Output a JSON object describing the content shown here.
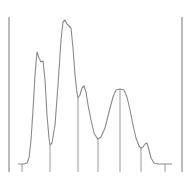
{
  "chart_data": {
    "type": "line",
    "title": "",
    "xlabel": "",
    "ylabel": "",
    "grid": false,
    "legend": null,
    "colors": {
      "trace": "#8a8a8a",
      "lines": "#9a9a9a",
      "border": "#8c8c8c"
    },
    "trace_points": [
      [
        18,
        164
      ],
      [
        24,
        164
      ],
      [
        27,
        163
      ],
      [
        29,
        158
      ],
      [
        31,
        140
      ],
      [
        33,
        110
      ],
      [
        35,
        75
      ],
      [
        37,
        52
      ],
      [
        39,
        58
      ],
      [
        41,
        62
      ],
      [
        43,
        61
      ],
      [
        45,
        80
      ],
      [
        47,
        115
      ],
      [
        49,
        138
      ],
      [
        50,
        145
      ],
      [
        52,
        143
      ],
      [
        55,
        125
      ],
      [
        58,
        85
      ],
      [
        61,
        40
      ],
      [
        63,
        22
      ],
      [
        65,
        20
      ],
      [
        67,
        24
      ],
      [
        69,
        26
      ],
      [
        71,
        28
      ],
      [
        73,
        48
      ],
      [
        75,
        75
      ],
      [
        77,
        93
      ],
      [
        78,
        98
      ],
      [
        80,
        95
      ],
      [
        82,
        88
      ],
      [
        84,
        86
      ],
      [
        86,
        92
      ],
      [
        88,
        105
      ],
      [
        91,
        120
      ],
      [
        94,
        133
      ],
      [
        97,
        138
      ],
      [
        98,
        139
      ],
      [
        101,
        137
      ],
      [
        105,
        128
      ],
      [
        109,
        112
      ],
      [
        113,
        97
      ],
      [
        116,
        90
      ],
      [
        120,
        89
      ],
      [
        124,
        90
      ],
      [
        127,
        97
      ],
      [
        130,
        110
      ],
      [
        133,
        125
      ],
      [
        136,
        138
      ],
      [
        139,
        146
      ],
      [
        141,
        148
      ],
      [
        143,
        147
      ],
      [
        145,
        144
      ],
      [
        147,
        143
      ],
      [
        149,
        150
      ],
      [
        151,
        158
      ],
      [
        154,
        163
      ],
      [
        158,
        164
      ],
      [
        172,
        164
      ]
    ],
    "boundary_lines_x": [
      50,
      78,
      98,
      120,
      141
    ],
    "baseline_ticks_x": [
      22,
      165
    ],
    "baseline_y": 164,
    "axis_bottom_y": 172,
    "frame": {
      "left_x": 9,
      "right_x": 182,
      "top_y": 17,
      "bottom_y": 172
    },
    "peaks": [
      {
        "id": 1,
        "apex_x": 37,
        "apex_y": 52,
        "start_x": 22,
        "end_x": 50
      },
      {
        "id": 2,
        "apex_x": 65,
        "apex_y": 20,
        "start_x": 50,
        "end_x": 78
      },
      {
        "id": 3,
        "apex_x": 84,
        "apex_y": 86,
        "start_x": 78,
        "end_x": 98
      },
      {
        "id": 4,
        "apex_x": 120,
        "apex_y": 89,
        "start_x": 98,
        "end_x": 141
      },
      {
        "id": 5,
        "apex_x": 147,
        "apex_y": 143,
        "start_x": 141,
        "end_x": 165
      }
    ]
  }
}
